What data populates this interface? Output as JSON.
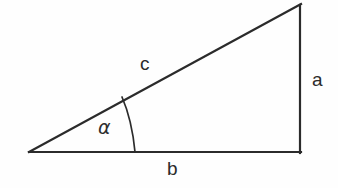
{
  "figure": {
    "kind": "right-triangle-diagram",
    "background_color": "#fefefe",
    "stroke_color": "#2b2b2b",
    "stroke_width": 2,
    "canvas": {
      "width": 338,
      "height": 188
    },
    "vertices": {
      "left": {
        "x": 29,
        "y": 152,
        "name": "left-vertex"
      },
      "bottom_right": {
        "x": 300,
        "y": 152,
        "name": "right-angle-vertex"
      },
      "top_right": {
        "x": 300,
        "y": 5,
        "name": "apex-vertex"
      }
    },
    "sides": {
      "hypotenuse": {
        "label": "c",
        "from": "left",
        "to": "top_right"
      },
      "vertical": {
        "label": "a",
        "from": "bottom_right",
        "to": "top_right"
      },
      "base": {
        "label": "b",
        "from": "left",
        "to": "bottom_right"
      }
    },
    "angle": {
      "label": "α",
      "at_vertex": "left",
      "arc_start": {
        "x": 122,
        "y": 97
      },
      "arc_end": {
        "x": 135,
        "y": 152
      },
      "arc_radius": 106
    }
  },
  "labels": {
    "hypotenuse": "c",
    "opposite_side": "a",
    "adjacent_side": "b",
    "angle": "α"
  }
}
